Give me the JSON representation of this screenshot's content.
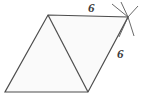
{
  "figure": {
    "name": "rhombus-with-diagonal",
    "background_color": "#ffffff",
    "fill_color": "#fafafa",
    "stroke_color": "#4d4d4d",
    "tick_color": "#585858",
    "label_color": "#3b3b3b",
    "stroke_width": 1.2,
    "vertices": {
      "top_apex": {
        "x": 48,
        "y": 15,
        "name": "top-left-apex"
      },
      "top_right": {
        "x": 128,
        "y": 17,
        "name": "top-right-vertex"
      },
      "bottom_left": {
        "x": 5,
        "y": 92,
        "name": "bottom-left-vertex"
      },
      "bottom_middle": {
        "x": 88,
        "y": 92,
        "name": "bottom-middle-vertex"
      }
    },
    "outline_path": "M 48 15 L 128 17 L 88 92 L 5 92 Z",
    "diagonal_path": "M 48 15 L 88 92",
    "tick_marks": {
      "vertex": {
        "x": 128,
        "y": 17
      },
      "count": 4,
      "rays": [
        {
          "x2": 112,
          "y2": 4
        },
        {
          "x2": 120,
          "y2": 2
        },
        {
          "x2": 137,
          "y2": 6
        },
        {
          "x2": 120,
          "y2": 38
        },
        {
          "x2": 135,
          "y2": 36
        }
      ]
    }
  },
  "labels": {
    "top_side": "6",
    "right_side": "6"
  },
  "measurements": {
    "top_side_length": 6,
    "right_side_length": 6,
    "unit": ""
  }
}
